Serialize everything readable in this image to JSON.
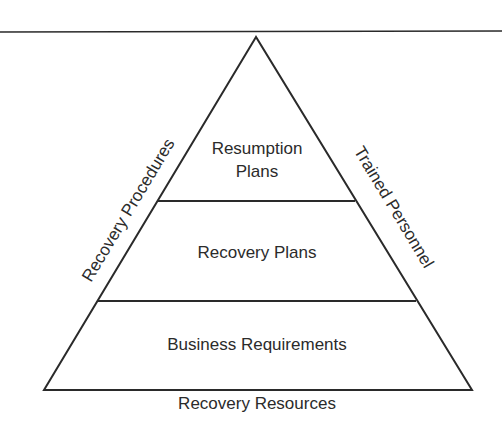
{
  "diagram": {
    "type": "pyramid",
    "tiers": [
      {
        "label_lines": [
          "Resumption",
          "Plans"
        ]
      },
      {
        "label_lines": [
          "Recovery Plans"
        ]
      },
      {
        "label_lines": [
          "Business Requirements"
        ]
      }
    ],
    "left_side_label": "Recovery Procedures",
    "right_side_label": "Trained Personnel",
    "base_label": "Recovery Resources"
  },
  "colors": {
    "line": "#2a2a2a",
    "text": "#2b2b2b",
    "background": "#ffffff"
  }
}
